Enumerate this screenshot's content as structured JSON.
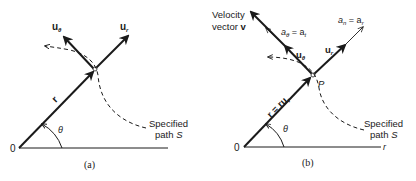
{
  "panels": [
    {
      "id": "a",
      "caption": "(a)",
      "origin_label": "0",
      "unit_r_label": "u",
      "unit_r_sub": "r",
      "unit_theta_label": "u",
      "unit_theta_sub": "θ",
      "position_label": "r",
      "angle_label": "θ",
      "path_label_line1": "Specified",
      "path_label_line2": "path ",
      "path_label_S": "S"
    },
    {
      "id": "b",
      "caption": "(b)",
      "origin_label": "0",
      "axis_label": "r",
      "point_label": "P",
      "velocity_label_line1": "Velocity",
      "velocity_label_line2": "vector ",
      "velocity_label_v": "v",
      "a_theta_label": "a",
      "a_theta_sub": "θ",
      "a_theta_eq": " = a",
      "a_theta_eq_sub": "t",
      "a_n_label": "a",
      "a_n_sub": "n",
      "a_n_eq": " = a",
      "a_n_eq_sub": "r",
      "unit_r_label": "u",
      "unit_r_sub": "r",
      "unit_theta_label": "u",
      "unit_theta_sub": "θ",
      "position_label": "r = ru",
      "position_sub": "r",
      "angle_label": "θ",
      "path_label_line1": "Specified",
      "path_label_line2": "path ",
      "path_label_S": "S"
    }
  ],
  "colors": {
    "ink": "#1a1a1a",
    "background": "#ffffff"
  }
}
